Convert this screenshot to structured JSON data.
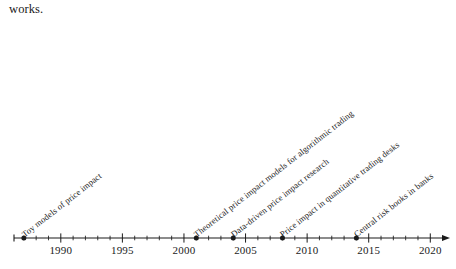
{
  "page": {
    "body_text": "works."
  },
  "figure": {
    "type": "timeline",
    "axis": {
      "start_year": 1986.2,
      "end_year": 2021.6,
      "arrow_end": true,
      "major_tick_step": 5,
      "minor_tick_step": 1,
      "year_labels": [
        "1990",
        "1995",
        "2000",
        "2005",
        "2010",
        "2015",
        "2020"
      ],
      "major_tick_years": [
        1990,
        1995,
        2000,
        2005,
        2010,
        2015,
        2020
      ]
    },
    "events": [
      {
        "year": 1987,
        "label": "Toy models of price impact"
      },
      {
        "year": 2001,
        "label": "Theoretical price impact models for algorithmic trading"
      },
      {
        "year": 2004,
        "label": "Data-driven price impact research"
      },
      {
        "year": 2008,
        "label": "Price impact in quantitative trading desks"
      },
      {
        "year": 2014,
        "label": "Central risk books in banks"
      }
    ],
    "colors": {
      "axis": "#1a1a1a",
      "marker": "#1a1a1a",
      "text": "#1a1a1a",
      "background": "#ffffff"
    }
  },
  "chart_data": {
    "type": "timeline",
    "title": "",
    "xlabel": "",
    "ylabel": "",
    "xlim": [
      1986.2,
      2021.6
    ],
    "grid": false,
    "legend": "none",
    "x": [
      1987,
      2001,
      2004,
      2008,
      2014
    ],
    "categories": [
      "Toy models of price impact",
      "Theoretical price impact models for algorithmic trading",
      "Data-driven price impact research",
      "Price impact in quantitative trading desks",
      "Central risk books in banks"
    ],
    "tick_labels": [
      "1990",
      "1995",
      "2000",
      "2005",
      "2010",
      "2015",
      "2020"
    ],
    "tick_values": [
      1990,
      1995,
      2000,
      2005,
      2010,
      2015,
      2020
    ],
    "minor_tick_step": 1
  }
}
